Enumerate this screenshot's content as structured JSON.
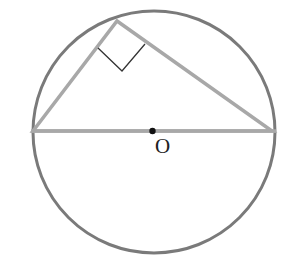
{
  "diagram": {
    "type": "geometry",
    "circle": {
      "cx": 154,
      "cy": 132,
      "r": 121,
      "stroke": "#7a7a7a"
    },
    "diameter": {
      "x1": 33,
      "y1": 131,
      "x2": 272,
      "y2": 131,
      "stroke": "#a8a8a8"
    },
    "triangle": {
      "vertices": [
        [
          33,
          131
        ],
        [
          117,
          21
        ],
        [
          272,
          131
        ]
      ],
      "stroke": "#a8a8a8"
    },
    "right_angle_marker": {
      "points": [
        [
          98,
          48
        ],
        [
          122,
          71
        ],
        [
          145,
          44
        ]
      ],
      "stroke": "#333333"
    },
    "center_point": {
      "x": 152,
      "y": 131,
      "label": "O"
    }
  }
}
